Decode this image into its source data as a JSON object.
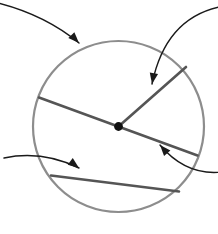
{
  "figure": {
    "type": "geometry-diagram",
    "canvas": {
      "width": 218,
      "height": 234,
      "background": "#ffffff"
    }
  },
  "colors": {
    "circle_outline": "#8d8d8d",
    "chord_line": "#555555",
    "center_dot": "#111111",
    "pointer_arrow": "#1a1a1a",
    "background": "#ffffff"
  },
  "strokes": {
    "circle_width": 2.2,
    "chord_width": 2.6,
    "arrow_width": 1.4
  },
  "circle": {
    "name": "main-circle",
    "center_x": 118.5,
    "center_y": 126.5,
    "radius": 85.5
  },
  "center_point": {
    "name": "circle-center-dot",
    "x": 118.5,
    "y": 126.5,
    "dot_radius": 4.4
  },
  "segments": [
    {
      "name": "radius-segment",
      "role": "radius",
      "x1": 118.5,
      "y1": 126.5,
      "x2": 186.0,
      "y2": 67.0
    },
    {
      "name": "diameter-segment",
      "role": "diameter",
      "x1": 39.0,
      "y1": 97.5,
      "x2": 197.5,
      "y2": 155.5
    },
    {
      "name": "chord-segment",
      "role": "chord",
      "x1": 51.0,
      "y1": 175.5,
      "x2": 179.0,
      "y2": 191.5
    }
  ],
  "pointer_arrows": [
    {
      "name": "pointer-arrow-to-circle",
      "target": "main-circle",
      "start_x": -6,
      "start_y": 2,
      "control_x": 44,
      "control_y": 14,
      "end_x": 79,
      "end_y": 43,
      "head_angle_deg": 46
    },
    {
      "name": "pointer-arrow-to-radius",
      "target": "radius-segment",
      "start_x": 224,
      "start_y": 6,
      "control_x": 166,
      "control_y": 16,
      "end_x": 152,
      "end_y": 84,
      "head_angle_deg": 100
    },
    {
      "name": "pointer-arrow-to-chord",
      "target": "chord-segment",
      "start_x": 4,
      "start_y": 158,
      "control_x": 42,
      "control_y": 150,
      "end_x": 79,
      "end_y": 168,
      "head_angle_deg": 37
    },
    {
      "name": "pointer-arrow-to-diameter",
      "target": "diameter-segment",
      "start_x": 222,
      "start_y": 172,
      "control_x": 186,
      "control_y": 176,
      "end_x": 160,
      "end_y": 145,
      "head_angle_deg": 229
    }
  ]
}
